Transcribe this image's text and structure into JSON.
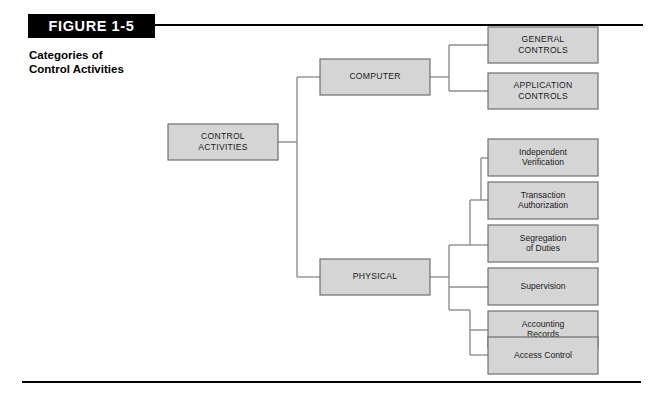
{
  "figure": {
    "banner_label": "FIGURE 1-5",
    "caption": "Categories of\nControl Activities"
  },
  "colors": {
    "banner_background": "#000000",
    "banner_text": "#ffffff",
    "rule": "#000000",
    "node_fill": "#d5d5d5",
    "node_border": "#6f6f6f",
    "connector": "#8e8e8e",
    "node_text": "#1a1a1a",
    "page_background": "#ffffff"
  },
  "chart_data": {
    "type": "diagram",
    "title": "Categories of Control Activities",
    "orientation": "left-to-right tree",
    "root": "CONTROL ACTIVITIES",
    "nodes": [
      {
        "id": "control-activities",
        "label": "CONTROL\nACTIVITIES",
        "text_case": "upper",
        "level": 0,
        "x": 168,
        "y": 124,
        "w": 110,
        "h": 36
      },
      {
        "id": "computer",
        "label": "COMPUTER",
        "text_case": "upper",
        "level": 1,
        "x": 320,
        "y": 59,
        "w": 110,
        "h": 36
      },
      {
        "id": "physical",
        "label": "PHYSICAL",
        "text_case": "upper",
        "level": 1,
        "x": 320,
        "y": 259,
        "w": 110,
        "h": 36
      },
      {
        "id": "general-controls",
        "label": "GENERAL\nCONTROLS",
        "text_case": "upper",
        "level": 2,
        "x": 488,
        "y": 27,
        "w": 110,
        "h": 36
      },
      {
        "id": "application-controls",
        "label": "APPLICATION\nCONTROLS",
        "text_case": "upper",
        "level": 2,
        "x": 488,
        "y": 73,
        "w": 110,
        "h": 36
      },
      {
        "id": "independent-verification",
        "label": "Independent\nVerification",
        "text_case": "title",
        "level": 2,
        "x": 488,
        "y": 139,
        "w": 110,
        "h": 37
      },
      {
        "id": "transaction-authorization",
        "label": "Transaction\nAuthorization",
        "text_case": "title",
        "level": 2,
        "x": 488,
        "y": 182,
        "w": 110,
        "h": 37
      },
      {
        "id": "segregation-of-duties",
        "label": "Segregation\nof Duties",
        "text_case": "title",
        "level": 2,
        "x": 488,
        "y": 225,
        "w": 110,
        "h": 37
      },
      {
        "id": "supervision",
        "label": "Supervision",
        "text_case": "title",
        "level": 2,
        "x": 488,
        "y": 268,
        "w": 110,
        "h": 37
      },
      {
        "id": "accounting-records",
        "label": "Accounting\nRecords",
        "text_case": "title",
        "level": 2,
        "x": 488,
        "y": 311,
        "w": 110,
        "h": 37
      },
      {
        "id": "access-control",
        "label": "Access Control",
        "text_case": "title",
        "level": 2,
        "x": 488,
        "y": 337,
        "w": 110,
        "h": 37
      }
    ],
    "edges": [
      {
        "from": "control-activities",
        "to": "computer"
      },
      {
        "from": "control-activities",
        "to": "physical"
      },
      {
        "from": "computer",
        "to": "general-controls"
      },
      {
        "from": "computer",
        "to": "application-controls"
      },
      {
        "from": "physical",
        "to": "independent-verification"
      },
      {
        "from": "physical",
        "to": "transaction-authorization"
      },
      {
        "from": "physical",
        "to": "segregation-of-duties"
      },
      {
        "from": "physical",
        "to": "supervision"
      },
      {
        "from": "physical",
        "to": "accounting-records"
      },
      {
        "from": "physical",
        "to": "access-control"
      }
    ],
    "connector_paths": [
      "M278,142 L297,142 L297,77 L320,77",
      "M297,142 L297,277 L320,277",
      "M430,77 L449,77 L449,45 L488,45",
      "M449,77 L449,91 L488,91",
      "M430,277 L449,277",
      "M449,277 L449,245 L462,245 L462,200 L470,200 L470,158 L488,158",
      "M470,200 L470,245 L488,200",
      "M462,245 L488,243",
      "M449,277 L488,287",
      "M449,277 L449,310 L462,310 L462,330 L488,330",
      "M462,310 L488,329"
    ],
    "connector_segments": [
      {
        "comment": "root to children bus",
        "points": [
          [
            278,
            142
          ],
          [
            297,
            142
          ]
        ]
      },
      {
        "comment": "vertical bus",
        "points": [
          [
            297,
            77
          ],
          [
            297,
            277
          ]
        ]
      },
      {
        "comment": "bus to computer",
        "points": [
          [
            297,
            77
          ],
          [
            320,
            77
          ]
        ]
      },
      {
        "comment": "bus to physical",
        "points": [
          [
            297,
            277
          ],
          [
            320,
            277
          ]
        ]
      },
      {
        "comment": "computer out",
        "points": [
          [
            430,
            77
          ],
          [
            449,
            77
          ]
        ]
      },
      {
        "comment": "computer bus",
        "points": [
          [
            449,
            45
          ],
          [
            449,
            91
          ]
        ]
      },
      {
        "comment": "to general",
        "points": [
          [
            449,
            45
          ],
          [
            488,
            45
          ]
        ]
      },
      {
        "comment": "to application",
        "points": [
          [
            449,
            91
          ],
          [
            488,
            91
          ]
        ]
      },
      {
        "comment": "physical out",
        "points": [
          [
            430,
            277
          ],
          [
            449,
            277
          ]
        ]
      },
      {
        "comment": "physical outer bus",
        "points": [
          [
            449,
            245
          ],
          [
            449,
            310
          ]
        ]
      },
      {
        "comment": "upper mid riser",
        "points": [
          [
            449,
            245
          ],
          [
            470,
            245
          ]
        ]
      },
      {
        "comment": "upper mid bus",
        "points": [
          [
            470,
            200
          ],
          [
            470,
            245
          ]
        ]
      },
      {
        "comment": "upper inner riser",
        "points": [
          [
            470,
            200
          ],
          [
            481,
            200
          ]
        ]
      },
      {
        "comment": "upper inner bus",
        "points": [
          [
            481,
            158
          ],
          [
            481,
            200
          ]
        ]
      },
      {
        "comment": "to independent",
        "points": [
          [
            481,
            158
          ],
          [
            488,
            158
          ]
        ]
      },
      {
        "comment": "to transaction",
        "points": [
          [
            481,
            200
          ],
          [
            488,
            200
          ]
        ]
      },
      {
        "comment": "to segregation",
        "points": [
          [
            470,
            245
          ],
          [
            488,
            245
          ]
        ]
      },
      {
        "comment": "to supervision",
        "points": [
          [
            449,
            287
          ],
          [
            488,
            287
          ]
        ]
      },
      {
        "comment": "lower mid riser",
        "points": [
          [
            449,
            310
          ],
          [
            470,
            310
          ]
        ]
      },
      {
        "comment": "lower inner bus",
        "points": [
          [
            470,
            310
          ],
          [
            470,
            355
          ]
        ]
      },
      {
        "comment": "to accounting",
        "points": [
          [
            470,
            330
          ],
          [
            488,
            330
          ]
        ]
      },
      {
        "comment": "to access",
        "points": [
          [
            470,
            355
          ],
          [
            488,
            355
          ]
        ]
      }
    ]
  }
}
